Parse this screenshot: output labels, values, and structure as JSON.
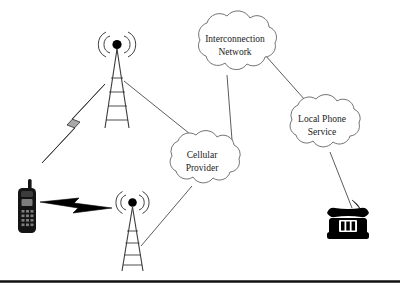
{
  "diagram": {
    "background_color": "#ffffff",
    "line_color": "#4a4a4a",
    "text_color": "#1a1a1a",
    "accent_color": "#000000",
    "width": 400,
    "height": 289
  },
  "clouds": [
    {
      "id": "interconnection-network",
      "label_line1": "Interconnection",
      "label_line2": "Network",
      "cx": 235,
      "cy": 45
    },
    {
      "id": "local-phone-service",
      "label_line1": "Local Phone",
      "label_line2": "Service",
      "cx": 322,
      "cy": 125
    },
    {
      "id": "cellular-provider",
      "label_line1": "Cellular",
      "label_line2": "Provider",
      "cx": 202,
      "cy": 161
    }
  ],
  "nodes": [
    {
      "id": "cell-phone",
      "name": "mobile-handset",
      "x": 28,
      "y": 205
    },
    {
      "id": "tower-upper",
      "name": "cell-tower-upper",
      "x": 117,
      "y": 50
    },
    {
      "id": "tower-lower",
      "name": "cell-tower-lower",
      "x": 133,
      "y": 207
    },
    {
      "id": "desk-phone",
      "name": "landline-telephone",
      "x": 345,
      "y": 222
    }
  ],
  "links": [
    {
      "from": "tower-upper",
      "to": "cellular-provider",
      "kind": "wired"
    },
    {
      "from": "tower-lower",
      "to": "cellular-provider",
      "kind": "wired"
    },
    {
      "from": "cellular-provider",
      "to": "interconnection-network",
      "kind": "wired"
    },
    {
      "from": "interconnection-network",
      "to": "local-phone-service",
      "kind": "wired"
    },
    {
      "from": "local-phone-service",
      "to": "desk-phone",
      "kind": "wired"
    }
  ],
  "wireless_links": [
    {
      "id": "bolt-upper",
      "name": "wireless-signal-upper",
      "style": "grey"
    },
    {
      "id": "bolt-lower",
      "name": "wireless-signal-lower",
      "style": "black"
    }
  ],
  "footer": {
    "rule_color": "#111111"
  }
}
